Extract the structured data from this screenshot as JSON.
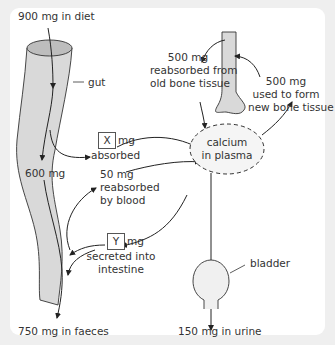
{
  "diagram": {
    "labels": {
      "diet": "900 mg in diet",
      "gut": "gut",
      "gut_flow": "600 mg",
      "faeces": "750 mg in faeces",
      "absorbed_box": "X",
      "absorbed_unit": "mg",
      "absorbed_text": "absorbed",
      "reabsorbed_blood_1": "50 mg",
      "reabsorbed_blood_2": "reabsorbed",
      "reabsorbed_blood_3": "by blood",
      "secreted_box": "Y",
      "secreted_unit": "mg",
      "secreted_text_1": "secreted into",
      "secreted_text_2": "intestine",
      "bone_reabsorbed_1": "500 mg",
      "bone_reabsorbed_2": "reabsorbed from",
      "bone_reabsorbed_3": "old bone tissue",
      "bone_formed_1": "500 mg",
      "bone_formed_2": "used to form",
      "bone_formed_3": "new bone tissue",
      "plasma_1": "calcium",
      "plasma_2": "in plasma",
      "bladder": "bladder",
      "urine": "150 mg in urine"
    },
    "colors": {
      "background": "#efefef",
      "panel": "#ffffff",
      "organ_fill": "#d9d9d9",
      "organ_top": "#bdbdbd",
      "line": "#222222",
      "text": "#333333"
    }
  }
}
